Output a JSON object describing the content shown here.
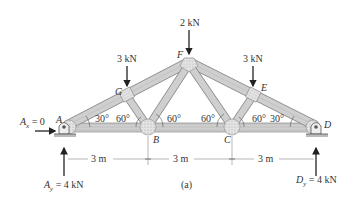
{
  "figure": {
    "caption": "(a)",
    "colors": {
      "member_fill": "#c9c9c9",
      "member_stroke": "#8a8a8a",
      "gusset_fill": "#dedede",
      "arrow": "#222222",
      "text": "#333333",
      "dimension_line": "#999999"
    }
  },
  "joints": {
    "A": "A",
    "B": "B",
    "C": "C",
    "D": "D",
    "E": "E",
    "F": "F",
    "G": "G"
  },
  "loads": {
    "G": "3 kN",
    "F": "2 kN",
    "E": "3 kN"
  },
  "reactions": {
    "Ax": {
      "symbol": "A",
      "sub": "x",
      "value": "= 0"
    },
    "Ay": {
      "symbol": "A",
      "sub": "y",
      "value": "= 4 kN"
    },
    "Dy": {
      "symbol": "D",
      "sub": "y",
      "value": "= 4 kN"
    }
  },
  "angles": {
    "a1": "30°",
    "a2": "60°",
    "a3": "60°",
    "a4": "60°",
    "a5": "60°",
    "a6": "30°"
  },
  "dimensions": [
    "3 m",
    "3 m",
    "3 m"
  ]
}
